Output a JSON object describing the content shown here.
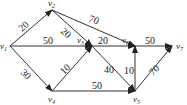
{
  "diagram": {
    "type": "directed-weighted-graph",
    "nodes": [
      {
        "id": "v1",
        "label": "v",
        "sub": "1",
        "x": 10,
        "y": 46,
        "lx": 0,
        "ly": 49
      },
      {
        "id": "v2",
        "label": "v",
        "sub": "2",
        "x": 52,
        "y": 10,
        "lx": 48,
        "ly": 6
      },
      {
        "id": "v3",
        "label": "v",
        "sub": "3",
        "x": 92,
        "y": 46,
        "lx": 77,
        "ly": 43
      },
      {
        "id": "v4",
        "label": "v",
        "sub": "4",
        "x": 52,
        "y": 91,
        "lx": 48,
        "ly": 102
      },
      {
        "id": "v5",
        "label": "v",
        "sub": "5",
        "x": 135,
        "y": 91,
        "lx": 133,
        "ly": 102
      },
      {
        "id": "v6",
        "label": "v",
        "sub": "6",
        "x": 135,
        "y": 46,
        "lx": 122,
        "ly": 43
      },
      {
        "id": "v7",
        "label": "v",
        "sub": "7",
        "x": 172,
        "y": 46,
        "lx": 176,
        "ly": 49
      }
    ],
    "edges": [
      {
        "from": "v1",
        "to": "v2",
        "weight": "20",
        "lx": 22,
        "ly": 32,
        "rot": -42
      },
      {
        "from": "v2",
        "to": "v3",
        "weight": "20",
        "lx": 60,
        "ly": 32,
        "rot": 42
      },
      {
        "from": "v2",
        "to": "v6",
        "weight": "70",
        "lx": 88,
        "ly": 21,
        "rot": 22
      },
      {
        "from": "v1",
        "to": "v3",
        "weight": "50",
        "lx": 43,
        "ly": 44,
        "rot": 0
      },
      {
        "from": "v1",
        "to": "v4",
        "weight": "30",
        "lx": 20,
        "ly": 73,
        "rot": 45
      },
      {
        "from": "v4",
        "to": "v3",
        "weight": "10",
        "lx": 64,
        "ly": 75,
        "rot": -45
      },
      {
        "from": "v3",
        "to": "v6",
        "weight": "20",
        "lx": 98,
        "ly": 44,
        "rot": 0
      },
      {
        "from": "v3",
        "to": "v5",
        "weight": "40",
        "lx": 104,
        "ly": 73,
        "rot": 0
      },
      {
        "from": "v4",
        "to": "v5",
        "weight": "50",
        "lx": 92,
        "ly": 89,
        "rot": 0
      },
      {
        "from": "v5",
        "to": "v6",
        "weight": "10",
        "lx": 124,
        "ly": 74,
        "rot": 0
      },
      {
        "from": "v6",
        "to": "v7",
        "weight": "50",
        "lx": 145,
        "ly": 44,
        "rot": 0
      },
      {
        "from": "v5",
        "to": "v7",
        "weight": "70",
        "lx": 153,
        "ly": 76,
        "rot": -45
      }
    ]
  }
}
